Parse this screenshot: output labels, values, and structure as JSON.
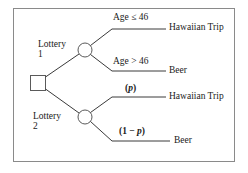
{
  "figure": {
    "type": "decision-tree",
    "border_color": "#8a8a8a",
    "line_color": "#3a3a3a",
    "text_color": "#1a1a1a"
  },
  "nodes": {
    "decision": {
      "shape": "square",
      "name": "decision-node",
      "x": 37,
      "y": 83,
      "size": 15
    },
    "chance_1": {
      "shape": "circle",
      "label_line1": "Lottery",
      "label_line2": "1",
      "x": 85,
      "y": 50,
      "radius": 7
    },
    "chance_2": {
      "shape": "circle",
      "label_line1": "Lottery",
      "label_line2": "2",
      "x": 85,
      "y": 117,
      "radius": 7
    }
  },
  "branches": [
    {
      "from": "chance_1",
      "probability_label": "Age ≤ 46",
      "outcome": "Hawaiian Trip"
    },
    {
      "from": "chance_1",
      "probability_label": "Age > 46",
      "outcome": "Beer"
    },
    {
      "from": "chance_2",
      "probability_label": "(p)",
      "probability_prefix": "(",
      "probability_symbol": "p",
      "probability_suffix": ")",
      "outcome": "Hawaiian Trip"
    },
    {
      "from": "chance_2",
      "probability_label": "(1 − p)",
      "probability_prefix": "(1 − ",
      "probability_symbol": "p",
      "probability_suffix": ")",
      "outcome": "Beer"
    }
  ]
}
